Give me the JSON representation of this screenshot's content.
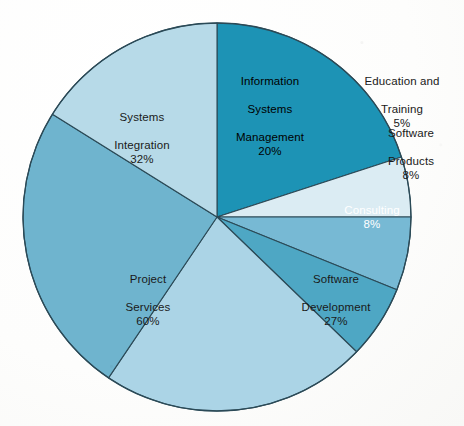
{
  "chart_data": {
    "type": "pie",
    "title": "",
    "subtitle": "",
    "xlabel": "",
    "ylabel": "",
    "legend_position": "none",
    "grid": false,
    "center": {
      "x": 217,
      "y": 217
    },
    "radius": 194,
    "start_angle_deg": 0,
    "direction": "clockwise",
    "background_color": "#ffffff",
    "outline_color": "#2b4a57",
    "categories": [
      "Information Systems Management",
      "Education and Training",
      "Software Products",
      "Consulting",
      "Software Development",
      "Project Services"
    ],
    "values": [
      20,
      5,
      8,
      8,
      27,
      60
    ],
    "slices": [
      {
        "name": "Information Systems Management",
        "label": "Information\nSystems\nManagement",
        "percent_text": "20%",
        "value": 20,
        "color": "#1d93b5",
        "start_deg": 0,
        "end_deg": 72,
        "label_placement": "inside",
        "label_color": "#ffffff"
      },
      {
        "name": "Education and Training",
        "label": "Education and\nTraining",
        "percent_text": "5%",
        "value": 5,
        "color": "#dbecf3",
        "start_deg": 72,
        "end_deg": 90,
        "label_placement": "outside",
        "label_color": "#1a1a1a"
      },
      {
        "name": "Software Products",
        "label": "Software\nProducts",
        "percent_text": "8%",
        "value": 8,
        "color": "#77b9d4",
        "start_deg": 90,
        "end_deg": 112,
        "label_placement": "outside",
        "label_color": "#1a1a1a"
      },
      {
        "name": "Consulting",
        "label": "Consulting",
        "percent_text": "8%",
        "value": 8,
        "color": "#4ea7c4",
        "start_deg": 112,
        "end_deg": 134,
        "label_placement": "inside",
        "label_color": "#ffffff"
      },
      {
        "name": "Software Development",
        "label": "Software\nDevelopment",
        "percent_text": "27%",
        "value": 27,
        "color": "#abd4e6",
        "start_deg": 134,
        "end_deg": 214,
        "label_placement": "inside",
        "label_color": "#1a1a1a"
      },
      {
        "name": "Project Services",
        "label": "Project\nServices",
        "percent_text": "60%",
        "value": 60,
        "color": "#6fb4ce",
        "start_deg": 214,
        "end_deg": 302,
        "label_placement": "inside",
        "label_color": "#1a1a1a"
      },
      {
        "name": "Systems Integration",
        "label": "Systems\nIntegration",
        "percent_text": "32%",
        "value": 32,
        "color": "#b7dae8",
        "start_deg": 302,
        "end_deg": 360,
        "label_placement": "inside",
        "label_color": "#1a1a1a"
      }
    ]
  },
  "colors": {
    "information_systems_management": "#1d93b5",
    "education_and_training": "#dbecf3",
    "software_products": "#77b9d4",
    "consulting": "#4ea7c4",
    "software_development": "#abd4e6",
    "project_services": "#6fb4ce",
    "systems_integration": "#b7dae8",
    "slice_outline": "#2b4a57",
    "page_background": "#ffffff",
    "label_dark": "#1a1a1a",
    "label_light": "#ffffff"
  },
  "labels": {
    "ism": {
      "line1": "Information",
      "line2": "Systems",
      "line3": "Management",
      "pct": "20%"
    },
    "education": {
      "line1": "Education and",
      "line2": "Training",
      "pct": "5%"
    },
    "software_products": {
      "line1": "Software",
      "line2": "Products",
      "pct": "8%"
    },
    "consulting": {
      "line1": "Consulting",
      "pct": "8%"
    },
    "software_development": {
      "line1": "Software",
      "line2": "Development",
      "pct": "27%"
    },
    "project_services": {
      "line1": "Project",
      "line2": "Services",
      "pct": "60%"
    },
    "systems_integration": {
      "line1": "Systems",
      "line2": "Integration",
      "pct": "32%"
    }
  }
}
